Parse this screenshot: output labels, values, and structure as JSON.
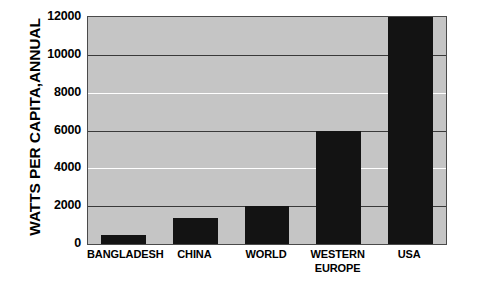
{
  "chart_data": {
    "type": "bar",
    "title": "",
    "subtitle": "",
    "xlabel": "",
    "ylabel": "WATTS PER CAPITA,ANNUAL",
    "categories": [
      "BANGLADESH",
      "CHINA",
      "WORLD",
      "WESTERN\nEUROPE",
      "USA"
    ],
    "values": [
      500,
      1400,
      2000,
      6000,
      12000
    ],
    "series": [
      {
        "name": "Watts per capita, annual",
        "values": [
          500,
          1400,
          2000,
          6000,
          12000
        ]
      }
    ],
    "ylim": [
      0,
      12000
    ],
    "ytick_labels": [
      "0",
      "2000",
      "4000",
      "6000",
      "8000",
      "10000",
      "12000"
    ],
    "ytick_values": [
      0,
      2000,
      4000,
      6000,
      8000,
      10000,
      12000
    ],
    "gridlines": [
      {
        "value": 2000,
        "style": "dark"
      },
      {
        "value": 4000,
        "style": "light"
      },
      {
        "value": 6000,
        "style": "dark"
      },
      {
        "value": 8000,
        "style": "light"
      },
      {
        "value": 10000,
        "style": "dark"
      }
    ],
    "grid": true,
    "legend": "none",
    "legend_position": "none",
    "bar_color": "#131313",
    "plot_background_color": "#c5c5c5",
    "page_background_color": "#ffffff",
    "axis_color": "#4a4a4a",
    "text_color": "#000000"
  }
}
